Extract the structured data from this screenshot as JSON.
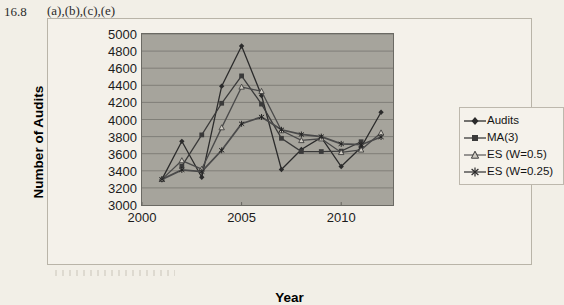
{
  "header": {
    "number": "16.8",
    "parts": "(a),(b),(c),(e)"
  },
  "chart_data": {
    "type": "line",
    "title": "",
    "xlabel": "Year",
    "ylabel": "Number of Audits",
    "x": [
      2001,
      2002,
      2003,
      2004,
      2005,
      2006,
      2007,
      2008,
      2009,
      2010,
      2011,
      2012
    ],
    "xlim": [
      2000,
      2012.6
    ],
    "ylim": [
      3000,
      5000
    ],
    "xticks": [
      2000,
      2005,
      2010
    ],
    "yticks": [
      3000,
      3200,
      3400,
      3600,
      3800,
      4000,
      4200,
      4400,
      4600,
      4800,
      5000
    ],
    "grid": "horizontal",
    "legend_position": "right",
    "plot_bg": "#a6a49c",
    "series": [
      {
        "name": "Audits",
        "marker": "filled-diamond",
        "color": "#2b2b2b",
        "x": [
          2001,
          2002,
          2003,
          2004,
          2005,
          2006,
          2007,
          2008,
          2009,
          2010,
          2011,
          2012
        ],
        "values": [
          3300,
          3745,
          3325,
          4390,
          4860,
          4280,
          3415,
          3650,
          3790,
          3450,
          3675,
          4085
        ]
      },
      {
        "name": "MA(3)",
        "marker": "filled-square",
        "color": "#3a3a3a",
        "x": [
          2002,
          2003,
          2004,
          2005,
          2006,
          2007,
          2008,
          2009,
          2010,
          2011
        ],
        "values": [
          3455,
          3820,
          4190,
          4510,
          4180,
          3780,
          3625,
          3625,
          3630,
          3740
        ]
      },
      {
        "name": "ES (W=0.5)",
        "marker": "open-triangle",
        "color": "#4a4a4a",
        "x": [
          2001,
          2002,
          2003,
          2004,
          2005,
          2006,
          2007,
          2008,
          2009,
          2010,
          2011,
          2012
        ],
        "values": [
          3300,
          3520,
          3420,
          3905,
          4380,
          4330,
          3870,
          3755,
          3775,
          3615,
          3645,
          3845
        ]
      },
      {
        "name": "ES (W=0.25)",
        "marker": "star",
        "color": "#4a4a4a",
        "x": [
          2001,
          2002,
          2003,
          2004,
          2005,
          2006,
          2007,
          2008,
          2009,
          2010,
          2011,
          2012
        ],
        "values": [
          3300,
          3410,
          3390,
          3640,
          3950,
          4030,
          3880,
          3825,
          3800,
          3715,
          3705,
          3795
        ]
      }
    ]
  },
  "legend": {
    "items": [
      {
        "label": "Audits"
      },
      {
        "label": "MA(3)"
      },
      {
        "label": "ES (W=0.5)"
      },
      {
        "label": "ES (W=0.25)"
      }
    ]
  }
}
